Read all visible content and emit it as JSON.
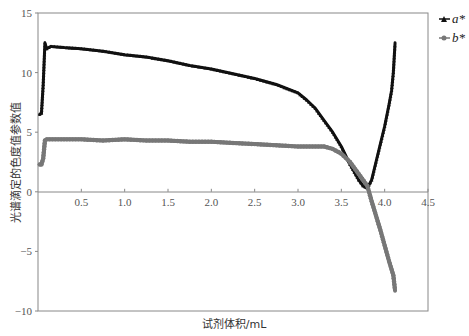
{
  "chart_data": {
    "type": "line",
    "title": "",
    "xlabel": "试剂体积/mL",
    "ylabel": "光谱滴定的色度值参数值",
    "xlim": [
      0,
      4.5
    ],
    "ylim": [
      -10,
      15
    ],
    "x_ticks": [
      "0.5",
      "1.0",
      "1.5",
      "2.0",
      "2.5",
      "3.0",
      "3.5",
      "4.0",
      "4.5"
    ],
    "y_ticks": [
      "15",
      "10",
      "5",
      "0",
      "-5",
      "-10"
    ],
    "grid": false,
    "legend_position": "right-top",
    "series": [
      {
        "name": "a*",
        "color": "#111111",
        "marker": "triangle",
        "x": [
          0.02,
          0.04,
          0.06,
          0.08,
          0.1,
          0.15,
          0.3,
          0.5,
          0.75,
          1.0,
          1.25,
          1.5,
          1.75,
          2.0,
          2.25,
          2.5,
          2.75,
          3.0,
          3.1,
          3.2,
          3.3,
          3.4,
          3.5,
          3.6,
          3.7,
          3.75,
          3.8,
          3.85,
          3.9,
          3.95,
          4.0,
          4.05,
          4.08,
          4.1,
          4.12
        ],
        "values": [
          6.5,
          6.6,
          9.0,
          12.5,
          12.0,
          12.2,
          12.1,
          12.0,
          11.8,
          11.5,
          11.3,
          11.0,
          10.6,
          10.3,
          9.9,
          9.5,
          9.0,
          8.3,
          7.7,
          7.0,
          6.0,
          5.0,
          3.8,
          2.3,
          1.0,
          0.5,
          0.3,
          1.0,
          2.5,
          4.0,
          5.5,
          7.3,
          8.5,
          10.0,
          12.5
        ]
      },
      {
        "name": "b*",
        "color": "#777777",
        "marker": "circle",
        "x": [
          0.02,
          0.04,
          0.06,
          0.08,
          0.1,
          0.3,
          0.5,
          0.75,
          1.0,
          1.25,
          1.5,
          1.75,
          2.0,
          2.25,
          2.5,
          2.75,
          3.0,
          3.2,
          3.3,
          3.4,
          3.5,
          3.6,
          3.7,
          3.8,
          3.85,
          3.9,
          3.95,
          4.0,
          4.05,
          4.1,
          4.12
        ],
        "values": [
          2.3,
          2.3,
          2.8,
          4.3,
          4.4,
          4.4,
          4.4,
          4.3,
          4.4,
          4.3,
          4.3,
          4.2,
          4.2,
          4.1,
          4.0,
          3.9,
          3.8,
          3.8,
          3.8,
          3.6,
          3.2,
          2.5,
          1.5,
          0.5,
          -0.8,
          -2.0,
          -3.2,
          -4.5,
          -5.8,
          -7.0,
          -8.3
        ]
      }
    ]
  }
}
